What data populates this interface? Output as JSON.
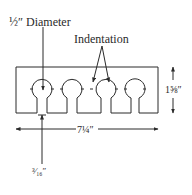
{
  "diagram": {
    "labels": {
      "hole_diameter": "½″ Diameter",
      "indentation": "Indentation",
      "height": "1⅝″",
      "width": "7¼″",
      "slot_width": "³⁄₁₆″"
    },
    "keyhole_count": 4,
    "colors": {
      "stroke": "#2a2a2a",
      "background": "#ffffff"
    }
  }
}
